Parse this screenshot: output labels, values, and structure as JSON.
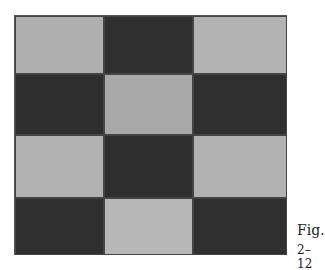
{
  "figure": {
    "caption_line1": "Fig.",
    "caption_line2": "2–12",
    "grid": {
      "rows": 4,
      "cols": 3,
      "cells": [
        [
          {
            "shade": "light",
            "color": "#d6d6d6"
          },
          {
            "shade": "dark",
            "color": "#6e6e6e"
          },
          {
            "shade": "light",
            "color": "#e0e0e0"
          }
        ],
        [
          {
            "shade": "dark",
            "color": "#6a6a6a"
          },
          {
            "shade": "medium-light",
            "color": "#c4c4c4"
          },
          {
            "shade": "dark",
            "color": "#6c6c6c"
          }
        ],
        [
          {
            "shade": "light",
            "color": "#dedede"
          },
          {
            "shade": "dark",
            "color": "#6a6a6a"
          },
          {
            "shade": "light",
            "color": "#dadada"
          }
        ],
        [
          {
            "shade": "dark",
            "color": "#6c6c6c"
          },
          {
            "shade": "very-light",
            "color": "#ececec"
          },
          {
            "shade": "dark",
            "color": "#707070"
          }
        ]
      ]
    }
  }
}
